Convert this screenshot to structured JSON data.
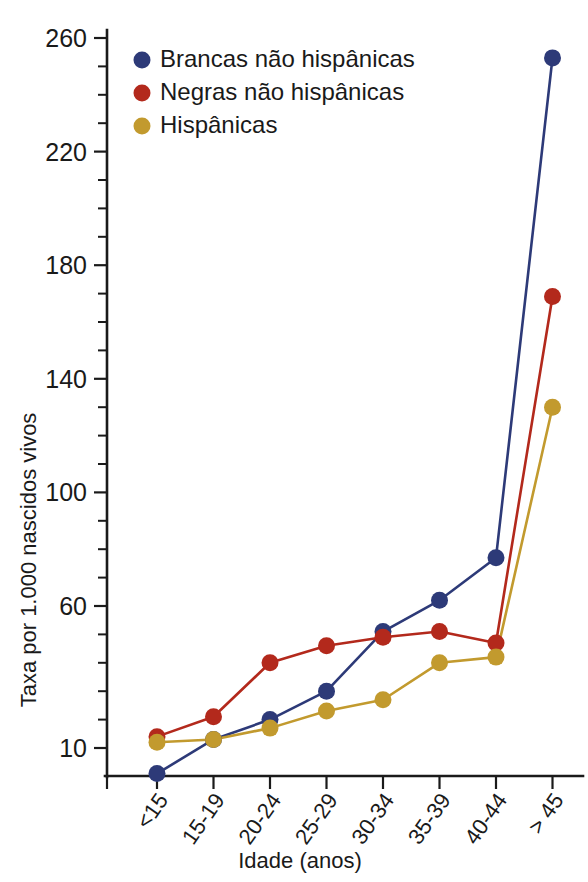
{
  "chart_data": {
    "type": "line",
    "title": "",
    "xlabel": "Idade (anos)",
    "ylabel": "Taxa por 1.000 nascidos vivos",
    "categories": [
      "<15",
      "15-19",
      "20-24",
      "25-29",
      "30-34",
      "35-39",
      "40-44",
      "> 45"
    ],
    "ylim": [
      0,
      265
    ],
    "yticks_major": [
      10,
      60,
      100,
      140,
      180,
      220,
      260
    ],
    "ytick_labels": [
      "10",
      "60",
      "100",
      "140",
      "180",
      "220",
      "260"
    ],
    "ytick_minor_step": 10,
    "grid": false,
    "legend_position": "top-left-inside",
    "series": [
      {
        "name": "Brancas não hispânicas",
        "color": "#2d3a78",
        "values": [
          1,
          13,
          20,
          30,
          51,
          62,
          77,
          253
        ]
      },
      {
        "name": "Negras não hispânicas",
        "color": "#b3291c",
        "values": [
          14,
          21,
          40,
          46,
          49,
          51,
          47,
          169
        ]
      },
      {
        "name": "Hispânicas",
        "color": "#c29a2e",
        "values": [
          12,
          13,
          17,
          23,
          27,
          40,
          42,
          130
        ]
      }
    ]
  },
  "legend": {
    "items": [
      {
        "label": "Brancas não hispânicas",
        "color": "#2d3a78"
      },
      {
        "label": "Negras não hispânicas",
        "color": "#b3291c"
      },
      {
        "label": "Hispânicas",
        "color": "#c29a2e"
      }
    ]
  },
  "axes": {
    "y_title": "Taxa por 1.000 nascidos vivos",
    "x_title": "Idade (anos)"
  }
}
